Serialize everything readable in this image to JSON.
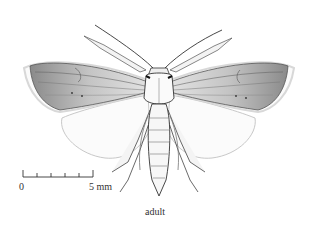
{
  "figure": {
    "caption": "adult",
    "scale_bar": {
      "start_label": "0",
      "end_label": "5 mm",
      "ticks": 6
    },
    "colors": {
      "ink": "#2a2a2a",
      "shade": "#6a6a6a",
      "hindwing_outline": "#c8c8c8",
      "background": "#ffffff"
    }
  }
}
